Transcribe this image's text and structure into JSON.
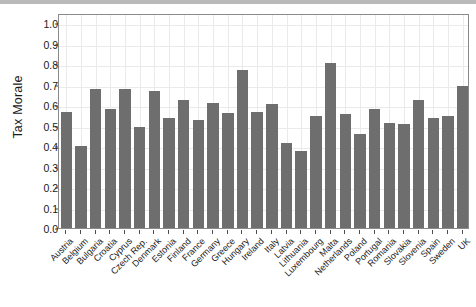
{
  "figure": {
    "background_color": "#ffffff",
    "bar_color": "#6e6e6e",
    "grid_color": "#eaeaea",
    "panel_border_color": "#8a8a8a"
  },
  "chart_data": {
    "type": "bar",
    "title": "",
    "subtitle": "",
    "xlabel": "",
    "ylabel": "Tax Morale",
    "ylim": [
      0.0,
      1.05
    ],
    "ytick_values": [
      0.0,
      0.1,
      0.2,
      0.3,
      0.4,
      0.5,
      0.6,
      0.7,
      0.8,
      0.9,
      1.0
    ],
    "ytick_labels": [
      "0.0",
      "0.1",
      "0.2",
      "0.3",
      "0.4",
      "0.5",
      "0.6",
      "0.7",
      "0.8",
      "0.9",
      "1.0"
    ],
    "grid": true,
    "legend": false,
    "legend_position": "none",
    "categories": [
      "Austria",
      "Belgium",
      "Bulgaria",
      "Croatia",
      "Cyprus",
      "Czech Rep.",
      "Denmark",
      "Estonia",
      "Finland",
      "France",
      "Germany",
      "Greece",
      "Hungary",
      "Ireland",
      "Italy",
      "Latvia",
      "Lithuania",
      "Luxembourg",
      "Malta",
      "Netherlands",
      "Poland",
      "Portugal",
      "Romania",
      "Slovakia",
      "Slovenia",
      "Spain",
      "Sweden",
      "UK"
    ],
    "values": [
      0.565,
      0.402,
      0.681,
      0.58,
      0.68,
      0.495,
      0.671,
      0.538,
      0.625,
      0.527,
      0.612,
      0.56,
      0.77,
      0.565,
      0.607,
      0.413,
      0.376,
      0.545,
      0.805,
      0.557,
      0.461,
      0.581,
      0.512,
      0.507,
      0.625,
      0.535,
      0.549,
      0.695
    ]
  }
}
